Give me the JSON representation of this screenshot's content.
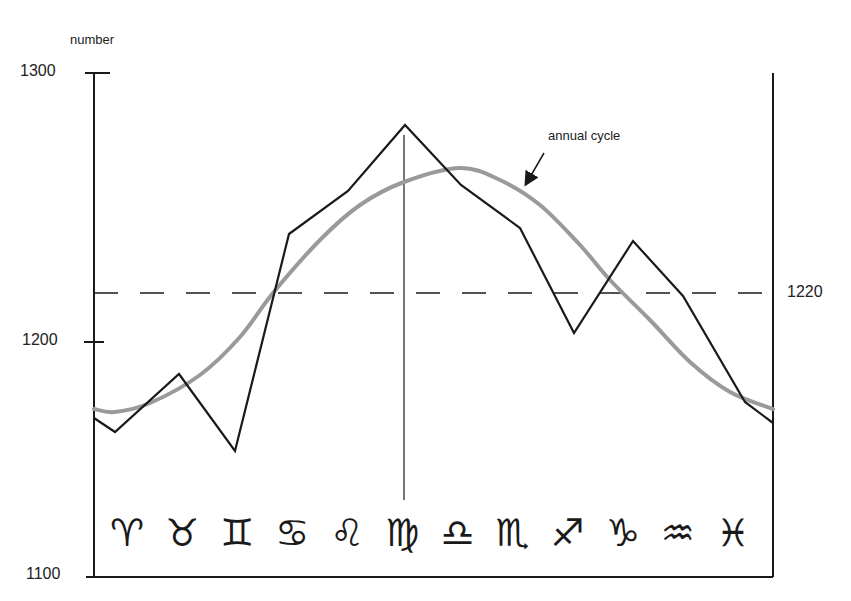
{
  "chart_data": {
    "type": "line",
    "title": "",
    "ylabel": "number",
    "xlabel": "",
    "ylim": [
      1100,
      1300
    ],
    "yticks": [
      "1300",
      "1200",
      "1100"
    ],
    "reference_line": {
      "value": 1220,
      "label": "1220",
      "style": "dashed"
    },
    "annotation": "annual cycle",
    "categories": [
      "Aries",
      "Taurus",
      "Gemini",
      "Cancer",
      "Leo",
      "Virgo",
      "Libra",
      "Scorpio",
      "Sagittarius",
      "Capricorn",
      "Aquarius",
      "Pisces"
    ],
    "category_symbols": [
      "♈",
      "♉",
      "♊",
      "♋",
      "♌",
      "♍",
      "♎",
      "♏",
      "♐",
      "♑",
      "♒",
      "♓"
    ],
    "series": [
      {
        "name": "observed",
        "color": "#1a1a1a",
        "x": [
          94,
          115,
          179,
          235,
          289,
          348,
          405,
          461,
          520,
          574,
          633,
          683,
          745,
          773
        ],
        "y_px": [
          418,
          432,
          374,
          451,
          234,
          191,
          125,
          185,
          228,
          333,
          241,
          296,
          402,
          423
        ],
        "values": [
          1168,
          1162,
          1187,
          1154,
          1240,
          1256,
          1280,
          1258,
          1242,
          1204,
          1238,
          1217,
          1174,
          1165
        ]
      },
      {
        "name": "annual cycle",
        "color": "#9a9a9a",
        "x": [
          94,
          115,
          150,
          200,
          240,
          273,
          320,
          360,
          404,
          460,
          500,
          540,
          580,
          610,
          650,
          690,
          730,
          773
        ],
        "y_px": [
          409,
          412,
          403,
          375,
          337,
          293,
          240,
          205,
          182,
          168,
          180,
          205,
          245,
          280,
          320,
          362,
          392,
          409
        ],
        "values": [
          1172,
          1170,
          1174,
          1186,
          1202,
          1220,
          1240,
          1253,
          1262,
          1267,
          1263,
          1253,
          1238,
          1225,
          1210,
          1192,
          1179,
          1172
        ]
      }
    ],
    "annual_peak_marker_x": 404,
    "legend": "none",
    "grid": false
  },
  "labels": {
    "ylabel": "number",
    "t1300": "1300",
    "t1200": "1200",
    "t1100": "1100",
    "t1220": "1220",
    "annotation": "annual cycle",
    "z0": "♈",
    "z1": "♉",
    "z2": "♊",
    "z3": "♋",
    "z4": "♌",
    "z5": "♍",
    "z6": "♎",
    "z7": "♏",
    "z8": "♐",
    "z9": "♑",
    "z10": "♒",
    "z11": "♓"
  }
}
